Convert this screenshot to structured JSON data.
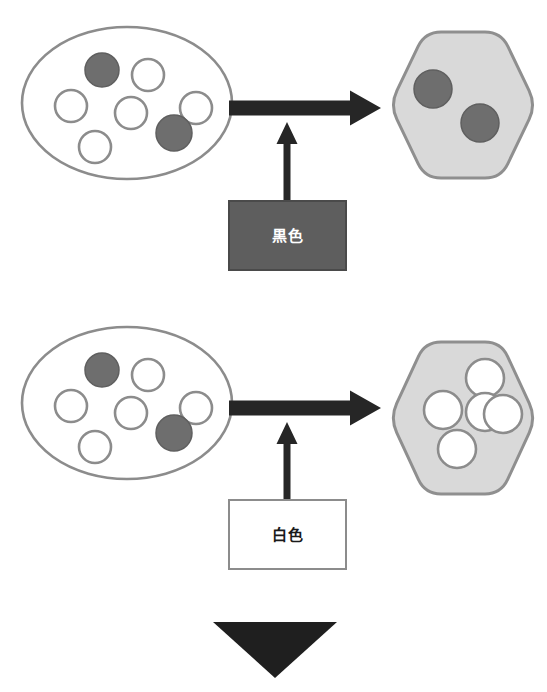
{
  "figure": {
    "background_color": "#ffffff",
    "width": 547,
    "height": 692
  },
  "palette": {
    "outline_gray": "#8c8c8c",
    "hexagon_fill": "#d9d9d9",
    "hexagon_stroke": "#8f8f8f",
    "filled_particle": "#6e6e6e",
    "filled_particle_stroke": "#5f5f5f",
    "hollow_particle_fill": "#ffffff",
    "hollow_particle_stroke": "#8c8c8c",
    "arrow_dark": "#262626",
    "black_box_fill": "#5e5e5e",
    "black_box_stroke": "#4a4a4a",
    "white_box_fill": "#ffffff",
    "white_box_stroke": "#8c8c8c",
    "black_box_text": "#ffffff",
    "white_box_text": "#1a1a1a",
    "bottom_triangle": "#1f1f1f"
  },
  "rows": [
    {
      "id": "black-row",
      "source": {
        "shape": "ellipse",
        "cx": 127,
        "cy": 103,
        "rx": 105,
        "ry": 76,
        "fill": "#ffffff",
        "stroke": "#8c8c8c",
        "particles": [
          {
            "cx": 102,
            "cy": 70,
            "r": 17,
            "state": "filled"
          },
          {
            "cx": 148,
            "cy": 75,
            "r": 16,
            "state": "hollow"
          },
          {
            "cx": 71,
            "cy": 106,
            "r": 16,
            "state": "hollow"
          },
          {
            "cx": 131,
            "cy": 113,
            "r": 16,
            "state": "hollow"
          },
          {
            "cx": 196,
            "cy": 108,
            "r": 16,
            "state": "hollow"
          },
          {
            "cx": 95,
            "cy": 147,
            "r": 16,
            "state": "hollow"
          },
          {
            "cx": 174,
            "cy": 133,
            "r": 18,
            "state": "filled"
          }
        ]
      },
      "target": {
        "shape": "hexagon",
        "cx": 463,
        "cy": 105,
        "width": 146,
        "height": 146,
        "fill": "#d9d9d9",
        "stroke": "#8f8f8f",
        "particles": [
          {
            "cx": 433,
            "cy": 89,
            "r": 19,
            "state": "filled"
          },
          {
            "cx": 480,
            "cy": 123,
            "r": 19,
            "state": "filled"
          }
        ]
      },
      "horizontal_arrow": {
        "from_x": 229,
        "to_x": 381,
        "y": 108,
        "thickness": 15,
        "head_width": 31,
        "head_height": 35,
        "color": "#262626"
      },
      "vertical_arrow": {
        "x": 287,
        "from_y": 201,
        "to_y": 122,
        "thickness": 7,
        "head_width": 21,
        "head_height": 22,
        "color": "#262626"
      },
      "agent_box": {
        "id": "black-agent-box",
        "label": "黒色",
        "kind": "black"
      }
    },
    {
      "id": "white-row",
      "source": {
        "shape": "ellipse",
        "cx": 127,
        "cy": 403,
        "rx": 105,
        "ry": 76,
        "fill": "#ffffff",
        "stroke": "#8c8c8c",
        "particles": [
          {
            "cx": 102,
            "cy": 370,
            "r": 17,
            "state": "filled"
          },
          {
            "cx": 148,
            "cy": 375,
            "r": 16,
            "state": "hollow"
          },
          {
            "cx": 71,
            "cy": 406,
            "r": 16,
            "state": "hollow"
          },
          {
            "cx": 131,
            "cy": 413,
            "r": 16,
            "state": "hollow"
          },
          {
            "cx": 196,
            "cy": 408,
            "r": 16,
            "state": "hollow"
          },
          {
            "cx": 95,
            "cy": 447,
            "r": 16,
            "state": "hollow"
          },
          {
            "cx": 174,
            "cy": 433,
            "r": 18,
            "state": "filled"
          }
        ]
      },
      "target": {
        "shape": "hexagon",
        "cx": 463,
        "cy": 418,
        "width": 146,
        "height": 152,
        "fill": "#d9d9d9",
        "stroke": "#8f8f8f",
        "particles": [
          {
            "cx": 485,
            "cy": 378,
            "r": 19,
            "state": "hollow"
          },
          {
            "cx": 443,
            "cy": 410,
            "r": 19,
            "state": "hollow"
          },
          {
            "cx": 485,
            "cy": 412,
            "r": 19,
            "state": "hollow"
          },
          {
            "cx": 503,
            "cy": 414,
            "r": 19,
            "state": "hollow"
          },
          {
            "cx": 457,
            "cy": 449,
            "r": 19,
            "state": "hollow"
          }
        ]
      },
      "horizontal_arrow": {
        "from_x": 229,
        "to_x": 381,
        "y": 408,
        "thickness": 15,
        "head_width": 31,
        "head_height": 35,
        "color": "#262626"
      },
      "vertical_arrow": {
        "x": 287,
        "from_y": 500,
        "to_y": 422,
        "thickness": 7,
        "head_width": 21,
        "head_height": 22,
        "color": "#262626"
      },
      "agent_box": {
        "id": "white-agent-box",
        "label": "白色",
        "kind": "white"
      }
    }
  ],
  "bottom_arrow": {
    "name": "down-arrow-icon",
    "left_x": 213,
    "right_x": 337,
    "top_y": 622,
    "tip_y": 678,
    "color": "#1f1f1f"
  }
}
